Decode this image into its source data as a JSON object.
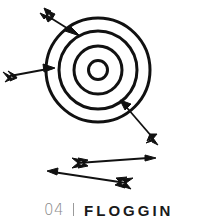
{
  "illustration": {
    "subject": "target-with-arrows-icon",
    "stroke_color": "#111111",
    "background": "#ffffff"
  },
  "caption": {
    "number": "04",
    "title": "FLOGGIN",
    "number_color": "#8a8a8a",
    "title_color": "#1a1a1a"
  }
}
